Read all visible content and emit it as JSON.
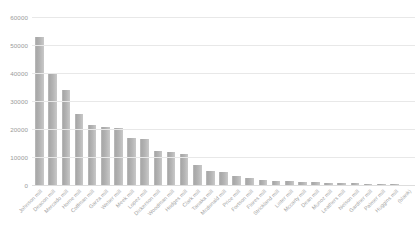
{
  "chart_data": {
    "type": "bar",
    "title": "",
    "xlabel": "",
    "ylabel": "",
    "ylim": [
      0,
      60000
    ],
    "grid": true,
    "legend": false,
    "y_ticks": [
      "0",
      "10000",
      "20000",
      "30000",
      "40000",
      "50000",
      "60000"
    ],
    "y_tick_values": [
      0,
      10000,
      20000,
      30000,
      40000,
      50000,
      60000
    ],
    "categories": [
      "Johnson mill",
      "Deacon mill",
      "Mercado mill",
      "Horne mill",
      "Coffman mill",
      "Garza mill",
      "Weber mill",
      "Meek mill",
      "Lopez mill",
      "Dickerson mill",
      "Woodman mill",
      "Hodges mill",
      "Clark mill",
      "Tanaka mill",
      "Mcdonald mill",
      "Price mill",
      "Fortson mill",
      "Flores mill",
      "Strickland mill",
      "Lister mill",
      "Mccarty mill",
      "Dean mill",
      "Munoz mill",
      "Leathers mill",
      "Nelson mill",
      "Gardner mill",
      "Palmer mill",
      "Huggins mill",
      "(blank)"
    ],
    "values": [
      53000,
      39500,
      34000,
      25500,
      21500,
      20800,
      20500,
      16800,
      16500,
      12000,
      11800,
      11000,
      7300,
      4900,
      4600,
      3300,
      2500,
      1900,
      1500,
      1300,
      1100,
      950,
      820,
      700,
      620,
      520,
      430,
      330,
      180
    ]
  },
  "style": {
    "bar_color": "#b3b3b3",
    "grid_color": "#e8e8e8",
    "text_color": "#a6a6a6",
    "background": "#ffffff"
  }
}
